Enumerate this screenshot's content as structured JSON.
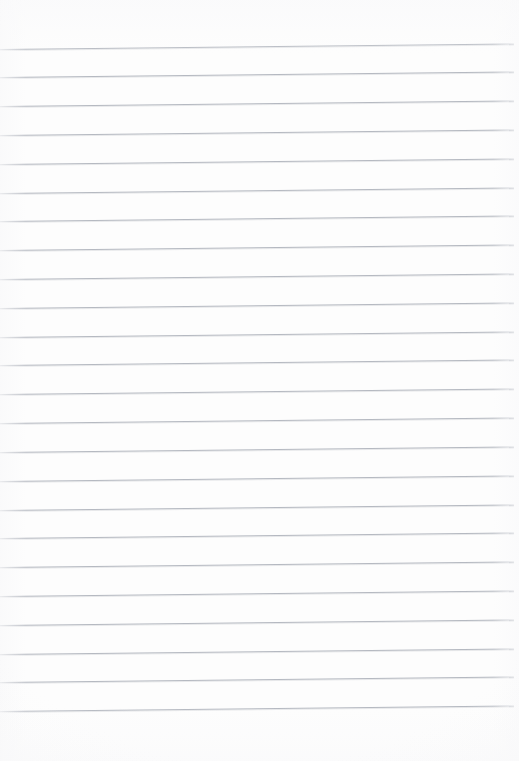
{
  "document": {
    "kind": "ruled-paper",
    "title": "Blank Ruled Paper",
    "page_content_text": "",
    "has_written_content": false,
    "has_margin_rule": false,
    "width_px": 519,
    "height_px": 761
  },
  "paper": {
    "background_color": "#fdfdfd",
    "edge_tint_color": "#f2f2f4",
    "top_margin_px": 48,
    "bottom_margin_px": 43,
    "left_inset_px": 0,
    "right_inset_px": 5
  },
  "rules": {
    "line_color": "#b5b9c1",
    "line_thickness_px": 1,
    "line_spacing_px": 28.8,
    "first_line_y_px": 48.5,
    "line_count": 24,
    "skew_deg": -0.62,
    "line_width_px": 514,
    "label": "ruled line"
  },
  "rule_lines": [
    {
      "index": 1,
      "y": 48.5
    },
    {
      "index": 2,
      "y": 77.3
    },
    {
      "index": 3,
      "y": 106.1
    },
    {
      "index": 4,
      "y": 134.9
    },
    {
      "index": 5,
      "y": 163.7
    },
    {
      "index": 6,
      "y": 192.6
    },
    {
      "index": 7,
      "y": 221.4
    },
    {
      "index": 8,
      "y": 250.2
    },
    {
      "index": 9,
      "y": 279.0
    },
    {
      "index": 10,
      "y": 307.8
    },
    {
      "index": 11,
      "y": 336.6
    },
    {
      "index": 12,
      "y": 365.4
    },
    {
      "index": 13,
      "y": 394.2
    },
    {
      "index": 14,
      "y": 423.1
    },
    {
      "index": 15,
      "y": 451.9
    },
    {
      "index": 16,
      "y": 480.7
    },
    {
      "index": 17,
      "y": 509.5
    },
    {
      "index": 18,
      "y": 538.3
    },
    {
      "index": 19,
      "y": 567.1
    },
    {
      "index": 20,
      "y": 595.9
    },
    {
      "index": 21,
      "y": 624.7
    },
    {
      "index": 22,
      "y": 653.6
    },
    {
      "index": 23,
      "y": 682.4
    },
    {
      "index": 24,
      "y": 711.2
    }
  ]
}
